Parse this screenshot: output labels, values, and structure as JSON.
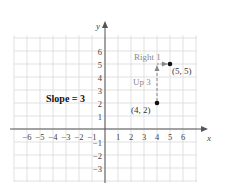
{
  "chart_data": {
    "type": "scatter",
    "title": "",
    "xlabel": "x",
    "ylabel": "y",
    "xlim": [
      -7,
      7
    ],
    "ylim": [
      -4,
      7
    ],
    "grid": true,
    "x_ticks": [
      "-6",
      "-5",
      "-4",
      "-3",
      "-2",
      "-1",
      "1",
      "2",
      "3",
      "4",
      "5",
      "6"
    ],
    "y_ticks": [
      "6",
      "5",
      "4",
      "3",
      "2",
      "1",
      "-1",
      "-2",
      "-3"
    ],
    "points": [
      {
        "x": 4,
        "y": 2,
        "label": "(4, 2)"
      },
      {
        "x": 5,
        "y": 5,
        "label": "(5, 5)"
      }
    ],
    "annotations": [
      {
        "text": "Up 3",
        "from": [
          4,
          2
        ],
        "to": [
          4,
          5
        ],
        "style": "dashed-arrow"
      },
      {
        "text": "Right 1",
        "from": [
          4,
          5
        ],
        "to": [
          5,
          5
        ],
        "style": "dashed-arrow"
      },
      {
        "text": "Slope = 3",
        "bold": true
      }
    ]
  },
  "labels": {
    "x_axis": "x",
    "y_axis": "y",
    "slope": "Slope = 3",
    "up": "Up 3",
    "right": "Right 1",
    "point_a": "(4, 2)",
    "point_b": "(5, 5)"
  },
  "colors": {
    "grid": "#d9d9d9",
    "axis": "#555555",
    "annotation": "#8a8a8a",
    "point": "#111111"
  }
}
